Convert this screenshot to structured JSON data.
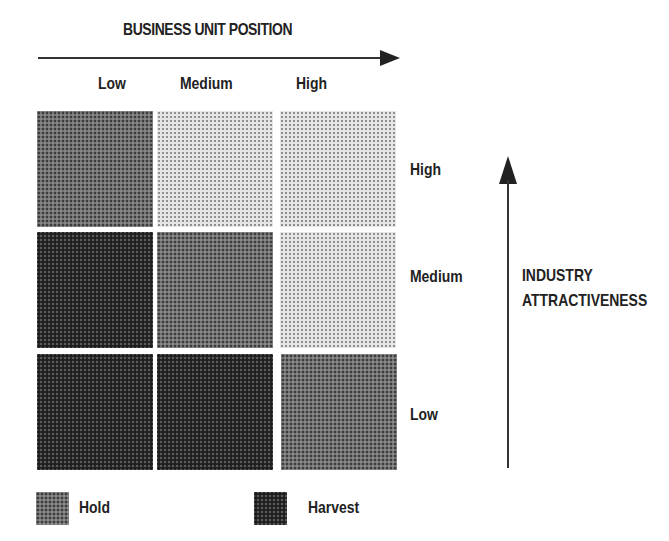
{
  "x_axis": {
    "title": "BUSINESS UNIT POSITION",
    "levels": [
      "Low",
      "Medium",
      "High"
    ]
  },
  "y_axis": {
    "title_line1": "INDUSTRY",
    "title_line2": "ATTRACTIVENESS",
    "levels": [
      "High",
      "Medium",
      "Low"
    ]
  },
  "grid": {
    "rows": [
      {
        "industry_attractiveness": "High",
        "cells": [
          "medium",
          "light",
          "light"
        ]
      },
      {
        "industry_attractiveness": "Medium",
        "cells": [
          "dark",
          "medium",
          "light"
        ]
      },
      {
        "industry_attractiveness": "Low",
        "cells": [
          "dark",
          "dark",
          "medium"
        ]
      }
    ]
  },
  "legend": [
    {
      "label": "Hold",
      "tone": "medium"
    },
    {
      "label": "Harvest",
      "tone": "dark"
    }
  ]
}
